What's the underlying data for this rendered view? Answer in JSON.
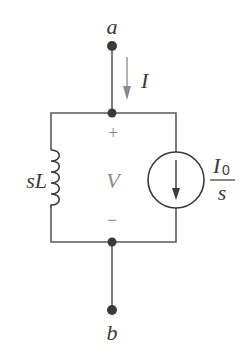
{
  "diagram": {
    "type": "circuit",
    "terminals": {
      "top": {
        "label": "a"
      },
      "bottom": {
        "label": "b"
      }
    },
    "current": {
      "label": "I",
      "direction": "down"
    },
    "voltage": {
      "label": "V",
      "plus": "+",
      "minus": "−"
    },
    "inductor": {
      "label_main": "sL"
    },
    "current_source": {
      "numerator": "I",
      "numerator_sub": "0",
      "denominator": "s",
      "direction": "down"
    },
    "colors": {
      "wire": "#5a5a5a",
      "node": "#3a3a3a",
      "annotation": "#8a8a8a"
    }
  }
}
